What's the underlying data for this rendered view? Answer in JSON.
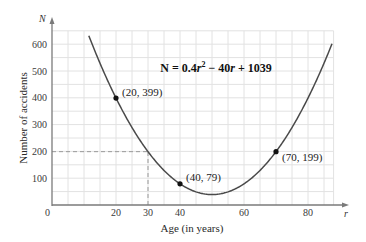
{
  "chart_data": {
    "type": "line",
    "title": "",
    "equation": "N = 0.4r² − 40r + 1039",
    "equation_parts": {
      "lhs": "N = 0.4",
      "var1": "r",
      "exp": "2",
      "rest": " − 40",
      "var2": "r",
      "tail": " + 1039"
    },
    "xlabel": "Age (in years)",
    "ylabel": "Number of accidents",
    "x_axis_var": "r",
    "y_axis_var": "N",
    "origin_label": "0",
    "xlim": [
      0,
      88
    ],
    "ylim": [
      0,
      650
    ],
    "x_ticks": [
      20,
      30,
      40,
      60,
      80
    ],
    "x_tick_labels": [
      "20",
      "30",
      "40",
      "60",
      "80"
    ],
    "y_ticks": [
      100,
      200,
      300,
      400,
      500,
      600
    ],
    "y_tick_labels": [
      "100",
      "200",
      "300",
      "400",
      "500",
      "600"
    ],
    "grid": true,
    "grid_x_step": 5,
    "grid_y_step": 50,
    "series": [
      {
        "name": "N = 0.4r^2 - 40r + 1039",
        "function": {
          "a": 0.4,
          "b": -40,
          "c": 1039
        },
        "domain": [
          11.5,
          87.6
        ],
        "color": "#4a4a4a"
      }
    ],
    "points": [
      {
        "x": 20,
        "y": 399,
        "label": "(20, 399)"
      },
      {
        "x": 40,
        "y": 79,
        "label": "(40, 79)"
      },
      {
        "x": 70,
        "y": 199,
        "label": "(70, 199)"
      }
    ],
    "annotations": [
      {
        "type": "dashed-guide",
        "x": 30,
        "y": 199,
        "description": "dashed lines from r=30 up to curve and across to N=200"
      }
    ],
    "colors": {
      "grid": "#e2e2e2",
      "axis": "#7a7a7a",
      "curve": "#4a4a4a",
      "point": "#111111",
      "dashed": "#999999"
    }
  }
}
